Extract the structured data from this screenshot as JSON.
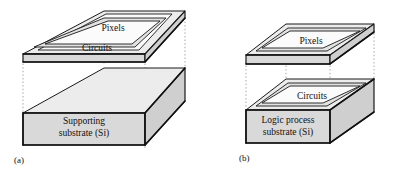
{
  "figure": {
    "background_color": "#ffffff",
    "line_color": "#1a1a1a",
    "fill_light": "#ececec",
    "fill_mid": "#d9d9d9",
    "fill_dark": "#cfcfcf",
    "guide_color": "#9a9a9a"
  },
  "panels": [
    {
      "id": "a",
      "caption": "(a)",
      "top_plate": {
        "label": "Pixels",
        "secondary_label": "Circuits"
      },
      "substrate": {
        "line1": "Supporting",
        "line2": "substrate  (Si)"
      }
    },
    {
      "id": "b",
      "caption": "(b)",
      "top_plate": {
        "label": "Pixels"
      },
      "substrate": {
        "label": "Circuits",
        "line1": "Logic process",
        "line2": "substrate  (Si)"
      }
    }
  ]
}
